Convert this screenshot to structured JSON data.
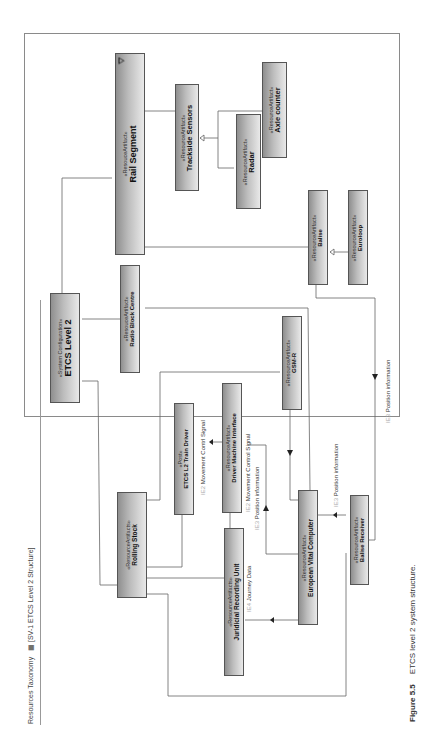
{
  "diagram": {
    "frame_title": "Resources Taxonomy",
    "view_name": "[SV-1 ETCS Level 2 Structure]",
    "caption": {
      "label": "Figure 5.5",
      "text": "ETCS level 2 system structure."
    },
    "nodes": {
      "rail_segment": {
        "stereotype": "«ResouceArtifact»",
        "name": "Rail Segment"
      },
      "trackside_sensors": {
        "stereotype": "«ResourceArtifact»",
        "name": "Trackside Sensors"
      },
      "radar": {
        "stereotype": "«ResourceArtifact»",
        "name": "Radar"
      },
      "axle_counter": {
        "stereotype": "«ResourceArtifact»",
        "name": "Axle counter"
      },
      "balise": {
        "stereotype": "«ResourceArtifact»",
        "name": "Balise"
      },
      "euroloop": {
        "stereotype": "«ResourceArtifact»",
        "name": "Euroloop"
      },
      "etcs_level2": {
        "stereotype": "«System Configuration»",
        "name": "ETCS Level 2"
      },
      "radio_block_centre": {
        "stereotype": "«ResouceArtifact»",
        "name": "Radio Block Centre"
      },
      "gsm_r": {
        "stereotype": "«ResourceArtifact»",
        "name": "GSM-R"
      },
      "etcs_l2_train_driver": {
        "stereotype": "«Post»",
        "name": "ETCS L2 Train Driver"
      },
      "dmi": {
        "stereotype": "«ResourceArtifact»",
        "name": "Driver Machine Interface"
      },
      "rolling_stock": {
        "stereotype": "«ResourceArtifacts»",
        "name": "Rolling Stock"
      },
      "jru": {
        "stereotype": "«ResourceArtifacts»",
        "name": "Juridicial Recording Unit"
      },
      "evc": {
        "stereotype": "«ResourceArtifact»",
        "name": "European Vital Computer"
      },
      "balise_receiver": {
        "stereotype": "«ResourceArtifact»",
        "name": "Balise Receiver"
      }
    },
    "flows": [
      {
        "id": "IE2",
        "text": "Movement Contrl Signal"
      },
      {
        "id": "IE2",
        "text": "Movement Control Signal"
      },
      {
        "id": "IE3",
        "text": "Position information"
      },
      {
        "id": "IE4",
        "text": "Journey Data"
      },
      {
        "id": "IE3",
        "text": "Position information"
      },
      {
        "id": "IE3",
        "text": "Position information"
      }
    ]
  }
}
